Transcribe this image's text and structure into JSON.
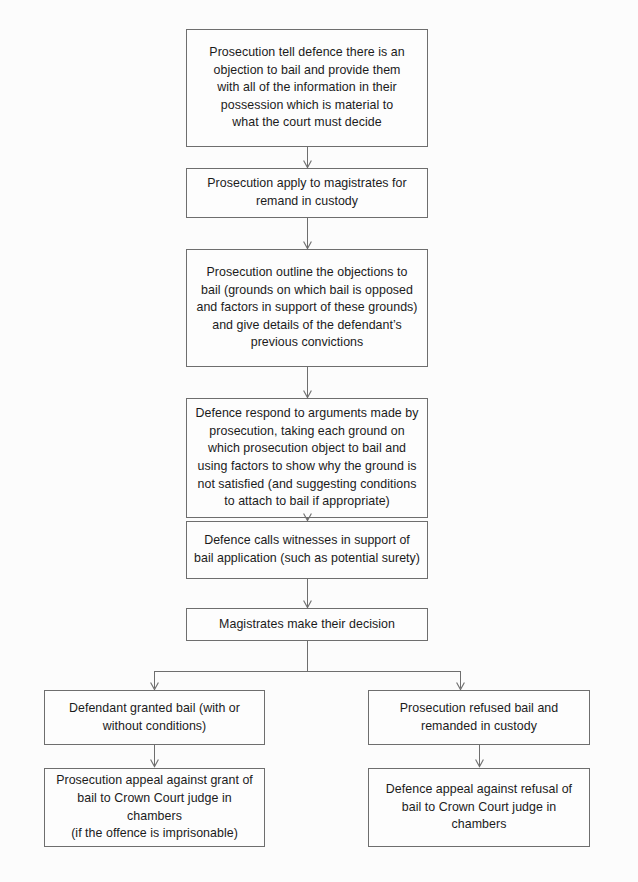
{
  "diagram": {
    "type": "flowchart",
    "background_color": "#fcfcfc",
    "line_color": "#6e6e6e",
    "text_color": "#1b1b1b",
    "nodes": [
      {
        "id": "prosecution-tell-defence",
        "text": "Prosecution tell defence there is an\nobjection to bail and provide them\nwith all of the information in their\npossession which is material to\nwhat the court must decide"
      },
      {
        "id": "prosecution-apply-remand",
        "text": "Prosecution apply to magistrates for\nremand in custody"
      },
      {
        "id": "prosecution-outline-objections",
        "text": "Prosecution outline the objections to\nbail (grounds on which bail is opposed\nand factors in support of these grounds)\nand give details of the defendant’s\nprevious convictions"
      },
      {
        "id": "defence-respond",
        "text": "Defence respond to arguments made by\nprosecution, taking each ground on\nwhich prosecution object to bail and\nusing factors to show why the ground is\nnot satisfied (and suggesting conditions\nto attach to bail if appropriate)"
      },
      {
        "id": "defence-calls-witnesses",
        "text": "Defence calls witnesses in support of\nbail application (such as potential surety)"
      },
      {
        "id": "magistrates-decision",
        "text": "Magistrates make their decision"
      },
      {
        "id": "defendant-granted-bail",
        "text": "Defendant granted bail (with or\nwithout conditions)"
      },
      {
        "id": "prosecution-refused-bail",
        "text": "Prosecution refused bail and\nremanded in custody"
      },
      {
        "id": "prosecution-appeal",
        "text": "Prosecution appeal against grant of\nbail to Crown Court judge in\nchambers\n(if the offence is imprisonable)"
      },
      {
        "id": "defence-appeal",
        "text": "Defence appeal against refusal of\nbail to Crown Court judge in\nchambers"
      }
    ],
    "connectors": [
      {
        "id": "c1",
        "from": "prosecution-tell-defence",
        "to": "prosecution-apply-remand",
        "style": "arrow"
      },
      {
        "id": "c2",
        "from": "prosecution-apply-remand",
        "to": "prosecution-outline-objections",
        "style": "arrow"
      },
      {
        "id": "c3",
        "from": "prosecution-outline-objections",
        "to": "defence-respond",
        "style": "arrow"
      },
      {
        "id": "c4",
        "from": "defence-respond",
        "to": "defence-calls-witnesses",
        "style": "arrow"
      },
      {
        "id": "c5",
        "from": "defence-calls-witnesses",
        "to": "magistrates-decision",
        "style": "arrow"
      },
      {
        "id": "c6",
        "from": "magistrates-decision",
        "to": "defendant-granted-bail",
        "style": "branch-arrow"
      },
      {
        "id": "c7",
        "from": "magistrates-decision",
        "to": "prosecution-refused-bail",
        "style": "branch-arrow"
      },
      {
        "id": "c8",
        "from": "defendant-granted-bail",
        "to": "prosecution-appeal",
        "style": "arrow"
      },
      {
        "id": "c9",
        "from": "prosecution-refused-bail",
        "to": "defence-appeal",
        "style": "arrow"
      }
    ]
  }
}
